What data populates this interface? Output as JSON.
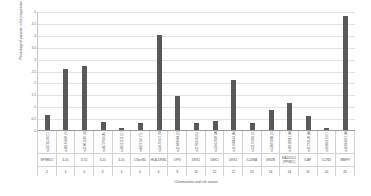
{
  "chart_data": {
    "type": "bar",
    "title": "",
    "xlabel": "Chromosome and risk variant",
    "ylabel": "Percentage of variance in the progression explained",
    "ylim": [
      0,
      5
    ],
    "yticks": [
      "0",
      "0.5",
      "1",
      "1.5",
      "2",
      "2.5",
      "3",
      "3.5",
      "4",
      "4.5",
      "5"
    ],
    "ytick_values": [
      0,
      0.5,
      1,
      1.5,
      2,
      2.5,
      3,
      3.5,
      4,
      4.5,
      5
    ],
    "grid": true,
    "legend": "none",
    "categories": [
      "SPRED2",
      "IL15",
      "IL15",
      "IL15",
      "IL15",
      "CSorf30",
      "HLA-DRB1",
      "OPG",
      "DKK1",
      "DKK1",
      "DKK1",
      "IL20RA",
      "GRZB",
      "RADX1L1 (PPM1L)",
      "ILAP",
      "CCND",
      "MMP9"
    ],
    "variants": [
      "rs1876518 (C)",
      "rs10161849 (G)",
      "rs11801146 (G)",
      "rs1077968 (A)",
      "rs10211111 (C)",
      "rs4821167 (T)",
      "rs13192471 (Major Europe)",
      "rs11688684 (C)",
      "rs1196828 (G)",
      "rs13412849 (A)",
      "rs11160433 (A)",
      "rs13192881 (C)",
      "rs13091840 (G)",
      "rs10110842 (A)",
      "rs11793120 (A)",
      "rs1106613 (C)",
      "rs11033822 (A)"
    ],
    "chromosomes": [
      "2",
      "4",
      "4",
      "4",
      "4",
      "6",
      "6",
      "8",
      "10",
      "12",
      "12",
      "13",
      "14",
      "14",
      "16",
      "20",
      "20"
    ],
    "values": [
      0.62,
      2.58,
      2.68,
      0.32,
      0.08,
      0.3,
      4.0,
      1.42,
      0.3,
      0.38,
      2.1,
      0.3,
      0.85,
      1.15,
      0.6,
      0.08,
      4.8
    ]
  }
}
